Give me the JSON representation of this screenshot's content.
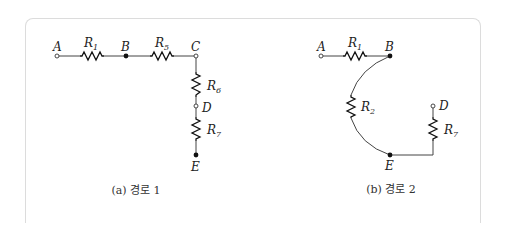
{
  "figure": {
    "panel_a": {
      "caption": "(a) 경로 1",
      "nodes": [
        {
          "id": "A",
          "label": "A",
          "type": "open"
        },
        {
          "id": "B",
          "label": "B",
          "type": "filled"
        },
        {
          "id": "C",
          "label": "C",
          "type": "open"
        },
        {
          "id": "D",
          "label": "D",
          "type": "open"
        },
        {
          "id": "E",
          "label": "E",
          "type": "filled"
        }
      ],
      "resistors": [
        {
          "name": "R",
          "sub": "1",
          "from": "A",
          "to": "B"
        },
        {
          "name": "R",
          "sub": "5",
          "from": "B",
          "to": "C"
        },
        {
          "name": "R",
          "sub": "6",
          "from": "C",
          "to": "D"
        },
        {
          "name": "R",
          "sub": "7",
          "from": "D",
          "to": "E"
        }
      ]
    },
    "panel_b": {
      "caption": "(b) 경로 2",
      "nodes": [
        {
          "id": "A",
          "label": "A",
          "type": "open"
        },
        {
          "id": "B",
          "label": "B",
          "type": "filled"
        },
        {
          "id": "E",
          "label": "E",
          "type": "filled"
        },
        {
          "id": "D",
          "label": "D",
          "type": "open"
        }
      ],
      "resistors": [
        {
          "name": "R",
          "sub": "1",
          "from": "A",
          "to": "B"
        },
        {
          "name": "R",
          "sub": "2",
          "from": "B",
          "to": "E"
        },
        {
          "name": "R",
          "sub": "7",
          "from": "E",
          "to": "D"
        }
      ]
    }
  }
}
